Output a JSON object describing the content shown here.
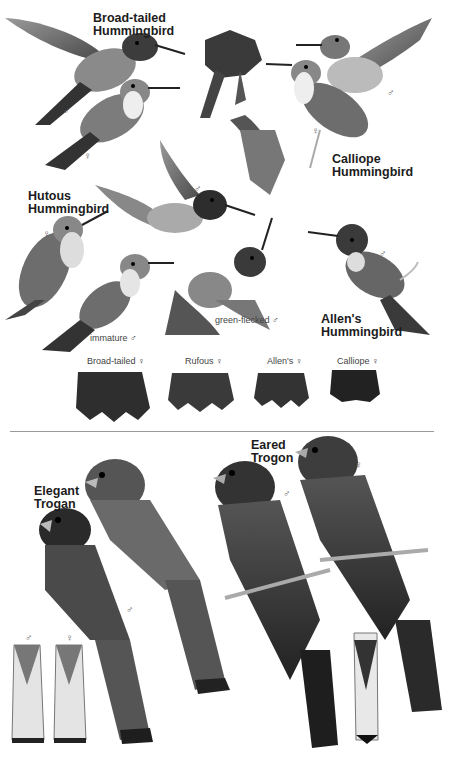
{
  "page": {
    "color_mode": "grayscale"
  },
  "hummingbirds": {
    "species_labels": [
      {
        "name": "Broad-tailed Hummingbird",
        "line1": "Broad-tailed",
        "line2": "Hummingbird"
      },
      {
        "name": "Calliope Hummingbird",
        "line1": "Calliope",
        "line2": "Hummingbird"
      },
      {
        "name": "Rufous Hummingbird",
        "line1": "Hutous",
        "line2": "Hummingbird"
      },
      {
        "name": "Allen's Hummingbird",
        "line1": "Allen's",
        "line2": "Hummingbird"
      }
    ],
    "notes": {
      "immature": "immature ♂",
      "green_flecked": "green-flecked ♂"
    },
    "sex_marks": {
      "male": "♂",
      "female": "♀"
    },
    "tail_comparison": [
      {
        "label": "Broad-tailed ♀"
      },
      {
        "label": "Rufous ♀"
      },
      {
        "label": "Allen's ♀"
      },
      {
        "label": "Calliope ♀"
      }
    ]
  },
  "trogons": {
    "species_labels": [
      {
        "name": "Elegant Trogon",
        "line1": "Elegant",
        "line2": "Trogan"
      },
      {
        "name": "Eared Trogon",
        "line1": "Eared",
        "line2": "Trogon"
      }
    ],
    "sex_marks": {
      "male": "♂",
      "female": "♀"
    }
  }
}
